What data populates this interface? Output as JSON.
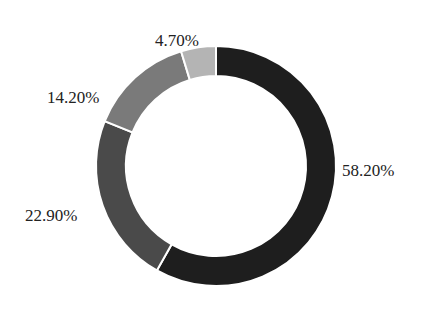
{
  "chart_data": {
    "type": "pie",
    "variant": "donut",
    "title": "",
    "start_angle_deg": 0,
    "direction": "clockwise",
    "slices": [
      {
        "label": "58.20%",
        "value": 58.2,
        "color": "#1e1e1e"
      },
      {
        "label": "22.90%",
        "value": 22.9,
        "color": "#4a4a4a"
      },
      {
        "label": "14.20%",
        "value": 14.2,
        "color": "#7a7a7a"
      },
      {
        "label": "4.70%",
        "value": 4.7,
        "color": "#b4b4b4"
      }
    ],
    "legend": "none",
    "separator_color": "#ffffff"
  },
  "labels": {
    "s0": "58.20%",
    "s1": "22.90%",
    "s2": "14.20%",
    "s3": "4.70%"
  }
}
